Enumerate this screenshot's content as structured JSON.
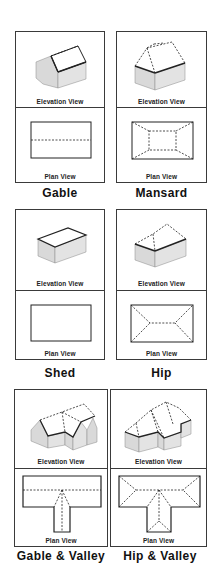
{
  "labels": {
    "elevation": "Elevation View",
    "plan": "Plan View"
  },
  "roof_types": [
    {
      "name": "Gable",
      "row": 1,
      "col": 1
    },
    {
      "name": "Mansard",
      "row": 1,
      "col": 2
    },
    {
      "name": "Shed",
      "row": 2,
      "col": 1
    },
    {
      "name": "Hip",
      "row": 2,
      "col": 2
    },
    {
      "name": "Gable & Valley",
      "row": 3,
      "col": 1
    },
    {
      "name": "Hip & Valley",
      "row": 3,
      "col": 2
    }
  ],
  "colors": {
    "border": "#3a3a3a",
    "wall_fill": "#d9d9d9",
    "roof_fill": "#ffffff",
    "line": "#222222"
  }
}
